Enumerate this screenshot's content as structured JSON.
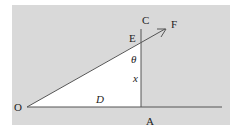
{
  "diagram": {
    "background_color": "#d9d9d9",
    "triangle_fill": "#ffffff",
    "line_color": "#555555",
    "points": {
      "O": {
        "label": "O"
      },
      "A": {
        "label": "A"
      },
      "C": {
        "label": "C"
      },
      "E": {
        "label": "E"
      },
      "F": {
        "label": "F"
      }
    },
    "labels": {
      "theta": "θ",
      "x": "x",
      "D": "D"
    }
  }
}
